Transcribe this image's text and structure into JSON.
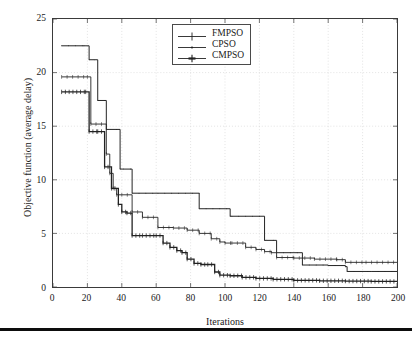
{
  "figure": {
    "background": "#ffffff",
    "frame_color": "#3a3a3a",
    "grid_color": "#cfcfcf",
    "bottom_rule_color": "#0d0d0d"
  },
  "legend": {
    "position": "top-center",
    "border_color": "#4a4a4a",
    "entries": [
      {
        "label": "FMPSO",
        "marker": "plus",
        "color": "#222222"
      },
      {
        "label": "CPSO",
        "marker": "dot",
        "color": "#222222"
      },
      {
        "label": "CMPSO",
        "marker": "asterisk",
        "color": "#222222"
      }
    ]
  },
  "chart_data": {
    "type": "line",
    "title": "",
    "subtitle": "",
    "xlabel": "Iterations",
    "ylabel": "Objective function (average delay)",
    "xlim": [
      0,
      200
    ],
    "ylim": [
      0,
      25
    ],
    "xticks": [
      0,
      20,
      40,
      60,
      80,
      100,
      120,
      140,
      160,
      180,
      200
    ],
    "yticks": [
      0,
      5,
      10,
      15,
      20,
      25
    ],
    "grid": true,
    "grid_style": "dotted-light",
    "step_style": "post",
    "legend_position": "top-center",
    "series": [
      {
        "name": "FMPSO",
        "marker": "plus",
        "color": "#222222",
        "linewidth": 0.9,
        "x": [
          5,
          20,
          22,
          25,
          31,
          33,
          35,
          37,
          40,
          46,
          52,
          61,
          70,
          78,
          85,
          92,
          97,
          100,
          104,
          112,
          118,
          123,
          127,
          130,
          140,
          152,
          165,
          170,
          182,
          200
        ],
        "y": [
          19.6,
          19.6,
          15.2,
          15.2,
          12.4,
          10.6,
          9.2,
          8.6,
          8.6,
          7.0,
          6.5,
          5.55,
          5.5,
          5.3,
          5.0,
          4.5,
          4.2,
          4.1,
          4.1,
          3.7,
          3.5,
          3.3,
          3.2,
          2.75,
          2.7,
          2.6,
          2.55,
          2.3,
          2.3,
          2.3
        ]
      },
      {
        "name": "CPSO",
        "marker": "dot",
        "color": "#222222",
        "linewidth": 1.0,
        "x": [
          5,
          18,
          21,
          24,
          26,
          31,
          33,
          39,
          41,
          46,
          61,
          85,
          103,
          104,
          123,
          124,
          130,
          145,
          160,
          170,
          171,
          185,
          200
        ],
        "y": [
          22.5,
          22.5,
          21.2,
          21.2,
          17.4,
          14.7,
          14.7,
          11.0,
          11.0,
          8.75,
          8.75,
          7.3,
          6.6,
          6.6,
          4.35,
          4.35,
          3.2,
          2.05,
          2.0,
          1.9,
          1.45,
          1.45,
          1.45
        ]
      },
      {
        "name": "CMPSO",
        "marker": "asterisk",
        "color": "#222222",
        "linewidth": 1.3,
        "x": [
          5,
          19,
          21,
          26,
          30,
          32,
          34,
          36,
          38,
          40,
          43,
          46,
          52,
          60,
          64,
          68,
          72,
          75,
          78,
          82,
          86,
          90,
          94,
          97,
          103,
          110,
          118,
          128,
          140,
          155,
          170,
          185,
          200
        ],
        "y": [
          18.2,
          18.2,
          14.5,
          14.5,
          11.2,
          11.2,
          9.2,
          9.2,
          7.7,
          7.0,
          6.9,
          4.8,
          4.8,
          4.8,
          4.1,
          3.7,
          3.4,
          3.2,
          2.6,
          2.2,
          2.1,
          2.1,
          1.4,
          1.1,
          1.05,
          0.9,
          0.8,
          0.72,
          0.62,
          0.58,
          0.55,
          0.52,
          0.5
        ]
      }
    ]
  }
}
